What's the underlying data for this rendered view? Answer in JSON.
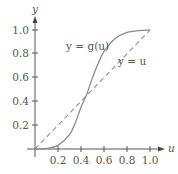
{
  "chart_data": {
    "type": "line",
    "title": "",
    "xlabel": "u",
    "ylabel": "y",
    "xlim": [
      0,
      1.0
    ],
    "ylim": [
      0,
      1.0
    ],
    "grid": false,
    "x_ticks": [
      "0.2",
      "0.4",
      "0.6",
      "0.8",
      "1.0"
    ],
    "y_ticks": [
      "0.2",
      "0.4",
      "0.6",
      "0.8",
      "1.0"
    ],
    "series": [
      {
        "name": "y = g(u)",
        "style": "solid",
        "x": [
          0,
          0.1,
          0.2,
          0.3,
          0.35,
          0.4,
          0.45,
          0.5,
          0.55,
          0.6,
          0.7,
          0.8,
          0.9,
          1.0
        ],
        "values": [
          0,
          0.005,
          0.03,
          0.12,
          0.22,
          0.35,
          0.46,
          0.6,
          0.72,
          0.82,
          0.93,
          0.98,
          0.995,
          1.0
        ]
      },
      {
        "name": "y = u",
        "style": "dashed",
        "x": [
          0,
          1.0
        ],
        "values": [
          0,
          1.0
        ]
      }
    ],
    "annotations": [
      {
        "text": "y = g(u)",
        "near": [
          0.45,
          0.8
        ]
      },
      {
        "text": "y = u",
        "near": [
          0.85,
          0.65
        ]
      }
    ],
    "legend_position": "none"
  },
  "labels": {
    "x_axis": "u",
    "y_axis": "y",
    "g_curve": "y = g(u)",
    "identity_line": "y = u",
    "xticks": [
      "0.2",
      "0.4",
      "0.6",
      "0.8",
      "1.0"
    ],
    "yticks": [
      "0.2",
      "0.4",
      "0.6",
      "0.8",
      "1.0"
    ]
  },
  "colors": {
    "axis": "#555555",
    "curve": "#8a8a8a",
    "dashed": "#9a9a9a"
  }
}
